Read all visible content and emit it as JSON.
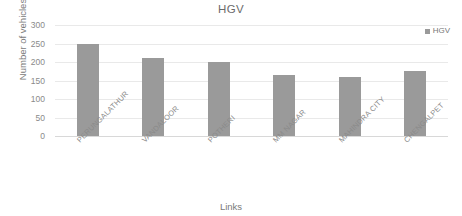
{
  "chart_data": {
    "type": "bar",
    "title": "HGV",
    "xlabel": "Links",
    "ylabel": "Number of vehicles",
    "categories": [
      "PERUNGALATHUR",
      "VANDALOOR",
      "POTHERI",
      "MM NAGAR",
      "MAHINDRA CITY",
      "CHENGALPET"
    ],
    "series": [
      {
        "name": "HGV",
        "values": [
          250,
          210,
          200,
          165,
          160,
          175
        ]
      }
    ],
    "values": [
      250,
      210,
      200,
      165,
      160,
      175
    ],
    "ylim": [
      0,
      300
    ],
    "ytick_labels": [
      "300",
      "250",
      "200",
      "150",
      "100",
      "50",
      "0"
    ],
    "ytick_values": [
      300,
      250,
      200,
      150,
      100,
      50,
      0
    ],
    "grid": true,
    "legend": {
      "position": "top-right",
      "entries": [
        {
          "label": "HGV",
          "color": "#9a9a9a",
          "marker": "legend-square-marker"
        }
      ]
    },
    "colors": {
      "bar": "#9a9a9a",
      "gridline": "#e9e9e9",
      "axis_line": "#d8d8d8",
      "text": "#7a7a7a",
      "background": "#ffffff"
    }
  }
}
